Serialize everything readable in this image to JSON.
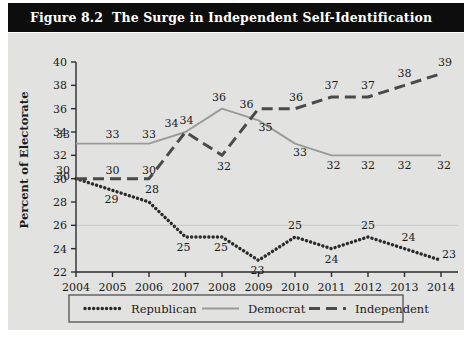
{
  "figure": {
    "number": "Figure 8.2",
    "title": "The Surge in Independent Self-Identification"
  },
  "chart_data": {
    "type": "line",
    "title": "The Surge in Independent Self-Identification",
    "xlabel": "",
    "ylabel": "Percent of Electorate",
    "categories": [
      "2004",
      "2005",
      "2006",
      "2007",
      "2008",
      "2009",
      "2010",
      "2011",
      "2012",
      "2013",
      "2014"
    ],
    "x": [
      2004,
      2005,
      2006,
      2007,
      2008,
      2009,
      2010,
      2011,
      2012,
      2013,
      2014
    ],
    "ylim": [
      22,
      40
    ],
    "yticks": [
      22,
      24,
      26,
      28,
      30,
      32,
      34,
      36,
      38,
      40
    ],
    "grid": false,
    "legend_position": "bottom",
    "series": [
      {
        "name": "Republican",
        "style": "dotted",
        "color": "#2b2b2b",
        "values": [
          30,
          29,
          28,
          25,
          25,
          23,
          25,
          24,
          25,
          24,
          23
        ]
      },
      {
        "name": "Democrat",
        "style": "solid",
        "color": "#9a9a9a",
        "values": [
          33,
          33,
          33,
          34,
          36,
          35,
          33,
          32,
          32,
          32,
          32
        ]
      },
      {
        "name": "Independent",
        "style": "dashed",
        "color": "#4a4a4a",
        "values": [
          30,
          30,
          30,
          34,
          32,
          36,
          36,
          37,
          37,
          38,
          39
        ]
      }
    ]
  },
  "legend": {
    "items": [
      {
        "label": "Republican",
        "swatch": "dotted-line-swatch"
      },
      {
        "label": "Democrat",
        "swatch": "solid-line-swatch"
      },
      {
        "label": "Independent",
        "swatch": "dashed-line-swatch"
      }
    ]
  },
  "colors": {
    "title_bar": "#0d0d0d",
    "title_text": "#ffffff",
    "panel_bg": "#e2e3e1",
    "axis": "#2b2b2b",
    "republican": "#2b2b2b",
    "democrat": "#9a9a9a",
    "independent": "#4a4a4a"
  }
}
